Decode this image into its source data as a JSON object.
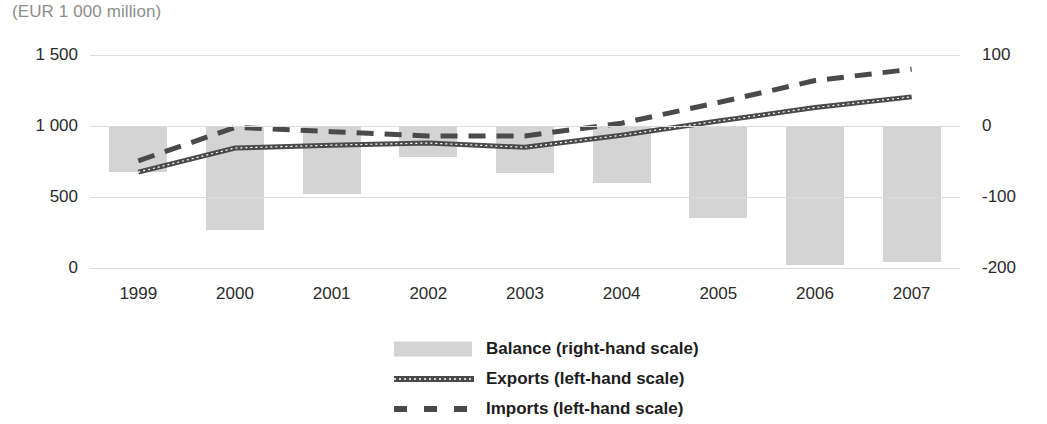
{
  "unit_note": "(EUR 1 000 million)",
  "legend": {
    "items": [
      {
        "label": "Balance (right-hand scale)",
        "marker": "bar-swatch"
      },
      {
        "label": "Exports (left-hand scale)",
        "marker": "solid-line-swatch"
      },
      {
        "label": "Imports (left-hand scale)",
        "marker": "dashed-line-swatch"
      }
    ]
  },
  "colors": {
    "bar_fill": "#d4d4d4",
    "line": "#4a4a4a",
    "gridline": "#dcdcdc",
    "text": "#2b2b2b",
    "note_text": "#8d8d8d"
  },
  "chart_data": {
    "type": "bar",
    "title": "",
    "subtitle": "",
    "unit": "(EUR 1 000 million)",
    "xlabel": "",
    "ylabel": "",
    "categories": [
      "1999",
      "2000",
      "2001",
      "2002",
      "2003",
      "2004",
      "2005",
      "2006",
      "2007"
    ],
    "grid": true,
    "legend_position": "bottom",
    "axes": {
      "left": {
        "label": "left-hand scale",
        "ticks": [
          "0",
          "500",
          "1 000",
          "1 500"
        ],
        "tick_values": [
          0,
          500,
          1000,
          1500
        ],
        "ylim": [
          0,
          1500
        ]
      },
      "right": {
        "label": "right-hand scale",
        "ticks": [
          "-200",
          "-100",
          "0",
          "100"
        ],
        "tick_values": [
          -200,
          -100,
          0,
          100
        ],
        "ylim": [
          -200,
          100
        ]
      }
    },
    "series": [
      {
        "name": "Balance (right-hand scale)",
        "type": "bar",
        "axis": "right",
        "values": [
          -65,
          -146,
          -96,
          -44,
          -66,
          -80,
          -130,
          -196,
          -192
        ]
      },
      {
        "name": "Exports (left-hand scale)",
        "type": "line",
        "style": "solid",
        "axis": "left",
        "values": [
          675,
          845,
          865,
          880,
          850,
          935,
          1035,
          1130,
          1205
        ]
      },
      {
        "name": "Imports (left-hand scale)",
        "type": "line",
        "style": "dashed",
        "axis": "left",
        "values": [
          755,
          990,
          960,
          930,
          930,
          1020,
          1165,
          1320,
          1400
        ]
      }
    ]
  }
}
